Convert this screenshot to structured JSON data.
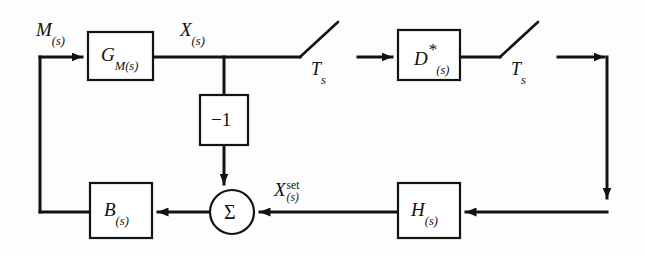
{
  "diagram": {
    "canvas": {
      "width": 645,
      "height": 256,
      "background": "#fdfdfd"
    },
    "ink_color": "#121212",
    "blocks": [
      {
        "id": "gm",
        "name": "process-block",
        "label_main": "G",
        "label_sub": "M(s)",
        "x": 88,
        "y": 32,
        "w": 65,
        "h": 48
      },
      {
        "id": "neg1",
        "name": "inverter-block",
        "label_main": "−1",
        "label_sub": "",
        "x": 200,
        "y": 95,
        "w": 48,
        "h": 50
      },
      {
        "id": "dstar",
        "name": "controller-block",
        "label_main": "D",
        "label_sub": "(s)",
        "x": 398,
        "y": 30,
        "w": 62,
        "h": 50,
        "superscript": "*"
      },
      {
        "id": "b",
        "name": "actuator-block",
        "label_main": "B",
        "label_sub": "(s)",
        "x": 90,
        "y": 183,
        "w": 62,
        "h": 55
      },
      {
        "id": "h",
        "name": "feedback-block",
        "label_main": "H",
        "label_sub": "(s)",
        "x": 398,
        "y": 183,
        "w": 62,
        "h": 55
      }
    ],
    "summing_junction": {
      "name": "summing-junction",
      "symbol": "Σ",
      "cx": 232,
      "cy": 212,
      "r": 22
    },
    "switches": [
      {
        "id": "sw1",
        "name": "sampler-switch-1",
        "label": "T",
        "label_sub": "s",
        "pivot_x": 300,
        "pivot_y": 57,
        "blade_x": 338,
        "blade_y": 22
      },
      {
        "id": "sw2",
        "name": "sampler-switch-2",
        "label": "T",
        "label_sub": "s",
        "pivot_x": 500,
        "pivot_y": 57,
        "blade_x": 538,
        "blade_y": 22
      }
    ],
    "signals": [
      {
        "id": "m",
        "name": "signal-label-m",
        "main": "M",
        "sub": "(s)",
        "sup": "",
        "x": 36,
        "y": 20
      },
      {
        "id": "x",
        "name": "signal-label-x",
        "main": "X",
        "sub": "(s)",
        "sup": "",
        "x": 178,
        "y": 20
      },
      {
        "id": "xset",
        "name": "signal-label-xset",
        "main": "X",
        "sub": "(s)",
        "sup": "set",
        "x": 272,
        "y": 180
      }
    ],
    "labels": {
      "gm_main": "G",
      "gm_sub": "M(s)",
      "neg_one": "−1",
      "d_main": "D",
      "d_star": "*",
      "d_sub": "(s)",
      "b_main": "B",
      "b_sub": "(s)",
      "h_main": "H",
      "h_sub": "(s)",
      "sigma": "Σ",
      "ts_1_main": "T",
      "ts_1_sub": "s",
      "ts_2_main": "T",
      "ts_2_sub": "s",
      "m_main": "M",
      "m_sub": "(s)",
      "x_main": "X",
      "x_sub": "(s)",
      "xset_main": "X",
      "xset_sup": "set",
      "xset_sub": "(s)"
    }
  }
}
